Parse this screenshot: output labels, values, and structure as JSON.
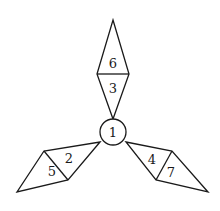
{
  "diagram": {
    "center_circle": {
      "label": "1"
    },
    "arms": [
      {
        "name": "top",
        "inner_label": "3",
        "outer_label": "6"
      },
      {
        "name": "left",
        "inner_label": "2",
        "outer_label": "5"
      },
      {
        "name": "right",
        "inner_label": "4",
        "outer_label": "7"
      }
    ],
    "colors": {
      "stroke": "#1a1a1a",
      "background": "#ffffff"
    }
  }
}
